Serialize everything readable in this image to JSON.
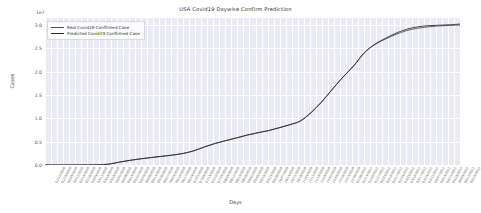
{
  "chart_data": {
    "type": "line",
    "title": "USA Covid19 Daywise Confirm Prediction",
    "xlabel": "Days",
    "ylabel": "Cases",
    "y_exponent_label": "1e7",
    "grid": true,
    "legend_position": "upper left",
    "ylim": [
      0.0,
      3.15
    ],
    "yticks": [
      "0.0",
      "0.5",
      "1.0",
      "1.5",
      "2.0",
      "2.5",
      "3.0"
    ],
    "ytick_values": [
      0.0,
      0.5,
      1.0,
      1.5,
      2.0,
      2.5,
      3.0
    ],
    "y_unit_scale": 10000000,
    "colors": {
      "real": "#4c4c4c",
      "predicted": "#2a2a2a",
      "axes_background": "#eaeaf2",
      "gridline": "#ffffff",
      "figure_background": "#ffffff"
    },
    "x": [
      "01/22/20",
      "02/03/20",
      "02/15/20",
      "02/27/20",
      "03/10/20",
      "03/22/20",
      "04/03/20",
      "04/15/20",
      "04/27/20",
      "05/09/20",
      "05/21/20",
      "06/02/20",
      "06/14/20",
      "06/26/20",
      "07/08/20",
      "07/20/20",
      "08/01/20",
      "08/13/20",
      "08/25/20",
      "09/06/20",
      "09/18/20",
      "09/30/20",
      "10/12/20",
      "10/24/20",
      "11/05/20",
      "11/17/20",
      "11/29/20",
      "12/11/20",
      "12/23/20",
      "01/04/21",
      "01/16/21",
      "01/28/21",
      "02/09/21",
      "02/21/21",
      "03/05/21",
      "03/17/21",
      "03/29/21",
      "04/10/21",
      "04/22/21",
      "05/04/21"
    ],
    "xtick_labels": [
      "01/22/2020",
      "01/29/2020",
      "02/05/2020",
      "02/12/2020",
      "02/19/2020",
      "02/26/2020",
      "03/04/2020",
      "03/11/2020",
      "03/18/2020",
      "03/25/2020",
      "04/01/2020",
      "04/08/2020",
      "04/15/2020",
      "04/22/2020",
      "04/29/2020",
      "05/06/2020",
      "05/13/2020",
      "05/20/2020",
      "05/27/2020",
      "06/03/2020",
      "06/10/2020",
      "06/17/2020",
      "06/24/2020",
      "07/01/2020",
      "07/08/2020",
      "07/15/2020",
      "07/22/2020",
      "07/29/2020",
      "08/05/2020",
      "08/12/2020",
      "08/19/2020",
      "08/26/2020",
      "09/02/2020",
      "09/09/2020",
      "09/16/2020",
      "09/23/2020",
      "09/30/2020",
      "10/07/2020",
      "10/14/2020",
      "10/21/2020",
      "10/28/2020",
      "11/04/2020",
      "11/11/2020",
      "11/18/2020",
      "11/25/2020",
      "12/02/2020",
      "12/09/2020",
      "12/16/2020",
      "12/23/2020",
      "12/30/2020",
      "01/06/2021",
      "01/13/2021",
      "01/20/2021",
      "01/27/2021",
      "02/03/2021",
      "02/10/2021",
      "02/17/2021",
      "02/24/2021",
      "03/03/2021",
      "03/10/2021",
      "03/17/2021",
      "03/24/2021",
      "03/31/2021",
      "04/07/2021",
      "04/14/2021",
      "04/21/2021",
      "04/28/2021",
      "05/05/2021",
      "05/12/2021",
      "05/19/2021"
    ],
    "series": [
      {
        "name": "Real Covid19 Confirmed Case",
        "color": "#4c4c4c",
        "values": [
          0.0001,
          0.0002,
          0.0003,
          0.0005,
          0.0008,
          0.0035,
          0.018,
          0.062,
          0.1,
          0.132,
          0.16,
          0.186,
          0.212,
          0.248,
          0.305,
          0.388,
          0.462,
          0.522,
          0.58,
          0.64,
          0.69,
          0.735,
          0.795,
          0.86,
          0.94,
          1.12,
          1.35,
          1.62,
          1.88,
          2.12,
          2.4,
          2.58,
          2.7,
          2.8,
          2.88,
          2.93,
          2.96,
          2.98,
          2.99,
          3.0
        ]
      },
      {
        "name": "Predicted Covid19 Confirmed Case",
        "color": "#2a2a2a",
        "values": [
          0.0001,
          0.0002,
          0.0003,
          0.0005,
          0.0009,
          0.004,
          0.019,
          0.063,
          0.101,
          0.133,
          0.161,
          0.187,
          0.213,
          0.249,
          0.306,
          0.389,
          0.463,
          0.523,
          0.581,
          0.642,
          0.692,
          0.738,
          0.799,
          0.865,
          0.945,
          1.125,
          1.355,
          1.625,
          1.885,
          2.125,
          2.405,
          2.59,
          2.715,
          2.825,
          2.91,
          2.96,
          2.985,
          2.995,
          3.005,
          3.02
        ]
      }
    ]
  },
  "legend": {
    "items": [
      {
        "label": "Real Covid19 Confirmed Case"
      },
      {
        "label": "Predicted Covid19 Confirmed Case"
      }
    ]
  }
}
